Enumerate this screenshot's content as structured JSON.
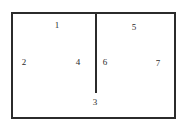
{
  "diagram": {
    "background_color": "#ffffff",
    "stroke_color": "#2b2b2b",
    "label_color": "#2b2b2b",
    "canvas": {
      "width": 188,
      "height": 129
    },
    "shapes": [
      {
        "name": "outer-rectangle",
        "type": "rectangle",
        "x": 11,
        "y": 12,
        "width": 165,
        "height": 107,
        "stroke_width": 2
      },
      {
        "name": "vertical-divider",
        "type": "line",
        "x": 95,
        "y": 12,
        "width": 2,
        "height": 81,
        "stroke_width": 2
      }
    ],
    "labels": [
      {
        "name": "label-1",
        "text": "1",
        "x": 57,
        "y": 25
      },
      {
        "name": "label-2",
        "text": "2",
        "x": 24,
        "y": 62
      },
      {
        "name": "label-3",
        "text": "3",
        "x": 95,
        "y": 102
      },
      {
        "name": "label-4",
        "text": "4",
        "x": 78,
        "y": 62
      },
      {
        "name": "label-5",
        "text": "5",
        "x": 134,
        "y": 27
      },
      {
        "name": "label-6",
        "text": "6",
        "x": 105,
        "y": 62
      },
      {
        "name": "label-7",
        "text": "7",
        "x": 158,
        "y": 63
      }
    ]
  }
}
